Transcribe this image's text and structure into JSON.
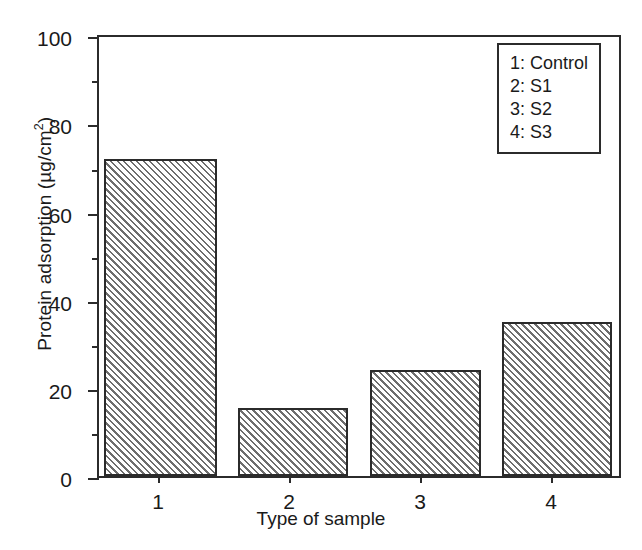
{
  "chart_data": {
    "type": "bar",
    "title": "",
    "xlabel": "Type of sample",
    "ylabel": "Protein adsorption (µg/cm²)",
    "ylabel_main": "Protein adsorption (µg/cm",
    "ylabel_sup": "2",
    "ylabel_tail": ")",
    "categories": [
      "1",
      "2",
      "3",
      "4"
    ],
    "values": [
      71.5,
      15.4,
      24.0,
      34.8
    ],
    "bars": [
      {
        "category": "1",
        "value": 71.5,
        "legend": "Control"
      },
      {
        "category": "2",
        "value": 15.4,
        "legend": "S1"
      },
      {
        "category": "3",
        "value": 24.0,
        "legend": "S2"
      },
      {
        "category": "4",
        "value": 34.8,
        "legend": "S3"
      }
    ],
    "ylim": [
      0,
      100
    ],
    "xlim": [
      0.5,
      4.5
    ],
    "ytick_major": [
      0,
      20,
      40,
      60,
      80,
      100
    ],
    "ytick_minor": [
      10,
      30,
      50,
      70,
      90
    ],
    "ytick_labels": [
      "0",
      "20",
      "40",
      "60",
      "80",
      "100"
    ],
    "xtick_labels": [
      "1",
      "2",
      "3",
      "4"
    ],
    "grid": false,
    "legend_position": "top-right",
    "bar_fill": "hatched-diagonal",
    "bar_edge_color": "#2b2b2b",
    "hatch_color": "#6e6e6e",
    "background_color": "#ffffff"
  },
  "legend": {
    "entries": [
      {
        "key": "1:",
        "label": "Control",
        "text": "1: Control"
      },
      {
        "key": "2:",
        "label": "S1",
        "text": "2: S1"
      },
      {
        "key": "3:",
        "label": "S2",
        "text": "3: S2"
      },
      {
        "key": "4:",
        "label": "S3",
        "text": "4: S3"
      }
    ]
  }
}
